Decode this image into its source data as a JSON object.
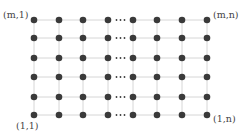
{
  "diagram": {
    "type": "grid-lattice",
    "rows": 6,
    "cols_drawn": 8,
    "ellipsis_after_col": 4,
    "ellipsis_text": "···",
    "x": [
      34,
      59,
      83,
      108,
      133,
      157,
      182,
      207
    ],
    "y": [
      20,
      38,
      58,
      77,
      97,
      115
    ],
    "colors": {
      "node": "#3a3a3a",
      "edge": "#d6d6d6",
      "text": "#444444"
    },
    "corner_labels": {
      "top_left": "(m,1)",
      "top_right": "(m,n)",
      "bottom_left": "(1,1)",
      "bottom_right": "(1,n)"
    }
  }
}
